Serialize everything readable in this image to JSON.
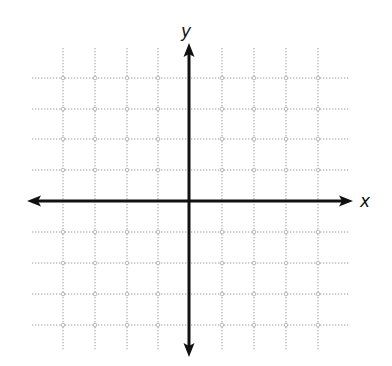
{
  "diagram": {
    "type": "coordinate-plane",
    "x_label": "x",
    "y_label": "y",
    "grid": {
      "x_lines": [
        63,
        95,
        127,
        158,
        222,
        254,
        286,
        318
      ],
      "y_lines": [
        78,
        109,
        139,
        170,
        232,
        263,
        294,
        325
      ],
      "x_extent": [
        32,
        350
      ],
      "y_extent": [
        48,
        350
      ],
      "style": "dotted",
      "color": "#9a9a9a",
      "intersection_marker": "small-circle"
    },
    "axes": {
      "origin": [
        189,
        201
      ],
      "x_axis": {
        "from": 27,
        "to": 353
      },
      "y_axis": {
        "from": 43,
        "to": 357
      },
      "color": "#111111",
      "stroke_width": 3,
      "arrows": [
        "left",
        "right",
        "up",
        "down"
      ]
    },
    "label_positions": {
      "x": [
        360,
        207
      ],
      "y": [
        181,
        37
      ]
    }
  }
}
